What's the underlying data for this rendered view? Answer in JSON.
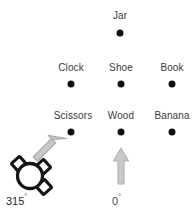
{
  "canvas": {
    "width": 196,
    "height": 216,
    "background": "#ffffff"
  },
  "colors": {
    "dot": "#101010",
    "label_text": "#3a3a3a",
    "arrow_fill": "#c9c9c9",
    "arrow_stroke": "#a8a8a8",
    "robot_outline": "#141414",
    "angle_text": "#4a4a4a"
  },
  "objects": [
    {
      "label": "Jar",
      "label_x": 120,
      "label_y": 10,
      "dot_x": 120,
      "dot_y": 33
    },
    {
      "label": "Clock",
      "label_x": 71,
      "label_y": 62,
      "dot_x": 71,
      "dot_y": 84
    },
    {
      "label": "Shoe",
      "label_x": 121,
      "label_y": 62,
      "dot_x": 121,
      "dot_y": 84
    },
    {
      "label": "Book",
      "label_x": 172,
      "label_y": 62,
      "dot_x": 172,
      "dot_y": 84
    },
    {
      "label": "Scissors",
      "label_x": 73,
      "label_y": 110,
      "dot_x": 71,
      "dot_y": 132
    },
    {
      "label": "Wood",
      "label_x": 121,
      "label_y": 110,
      "dot_x": 121,
      "dot_y": 132
    },
    {
      "label": "Banana",
      "label_x": 172,
      "label_y": 110,
      "dot_x": 172,
      "dot_y": 132
    }
  ],
  "robot": {
    "heading_label": "315",
    "degree_symbol": "°",
    "heading_label_x": 6,
    "heading_label_y": 192
  },
  "reference": {
    "heading_label": "0",
    "degree_symbol": "°",
    "heading_label_x": 112,
    "heading_label_y": 192
  },
  "icons": {
    "robot": "robot-icon",
    "robot_heading_arrow": "heading-arrow-icon",
    "reference_arrow": "reference-arrow-icon"
  }
}
